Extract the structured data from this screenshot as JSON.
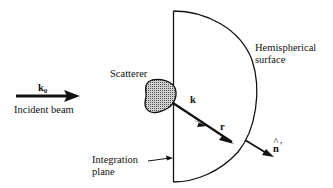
{
  "diagram": {
    "labels": {
      "incident_vector": "k",
      "incident_vector_sub": "0",
      "incident_beam": "Incident beam",
      "scatterer": "Scatterer",
      "scattered_vector": "k",
      "position_vector": "r",
      "normal_vector": "n",
      "normal_hat": "^",
      "normal_prime": "′",
      "hemisphere_line1": "Hemispherical",
      "hemisphere_line2": "surface",
      "plane_line1": "Integration",
      "plane_line2": "plane"
    },
    "colors": {
      "stroke": "#111111",
      "scatterer_fill": "#9a9a9a"
    }
  }
}
